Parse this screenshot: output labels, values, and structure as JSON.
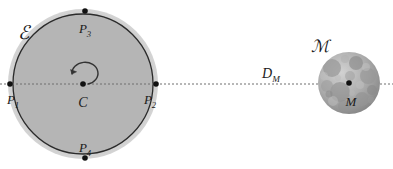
{
  "figure": {
    "background_color": "#ffffff"
  },
  "earth": {
    "label": "ℰ",
    "label_name": "script-E",
    "center_label": "C",
    "center": {
      "x": 83,
      "y": 84
    },
    "halo_radius": 75,
    "body_radius": 70,
    "halo_color": "#c9c9c9",
    "body_color": "#b4b4b4",
    "outline_color": "#2b2b2b",
    "rotation_direction": "counterclockwise",
    "points": [
      {
        "id": "P1",
        "label": "P",
        "sub": "1",
        "x": 10,
        "y": 84,
        "label_x": 13,
        "label_y": 102,
        "anchor": "middle"
      },
      {
        "id": "P2",
        "label": "P",
        "sub": "2",
        "x": 156,
        "y": 84,
        "label_x": 152,
        "label_y": 102,
        "anchor": "middle"
      },
      {
        "id": "P3",
        "label": "P",
        "sub": "3",
        "x": 85,
        "y": 11,
        "label_x": 85,
        "label_y": 33,
        "anchor": "middle"
      },
      {
        "id": "P4",
        "label": "P",
        "sub": "4",
        "x": 85,
        "y": 158,
        "label_x": 85,
        "label_y": 152,
        "anchor": "middle"
      }
    ]
  },
  "moon": {
    "label": "ℳ",
    "label_name": "script-M",
    "center_label": "M",
    "center": {
      "x": 349,
      "y": 83
    },
    "radius": 31,
    "base_color": "#a8a8a8",
    "label_x": 320,
    "label_y": 51,
    "center_label_x": 351,
    "center_label_y": 104,
    "craters": [
      {
        "cx": 332,
        "cy": 68,
        "r": 9,
        "fill": "#999999",
        "opacity": 0.75
      },
      {
        "cx": 356,
        "cy": 63,
        "r": 7,
        "fill": "#8f8f8f",
        "opacity": 0.7
      },
      {
        "cx": 368,
        "cy": 76,
        "r": 8,
        "fill": "#969696",
        "opacity": 0.65
      },
      {
        "cx": 340,
        "cy": 92,
        "r": 10,
        "fill": "#8d8d8d",
        "opacity": 0.6
      },
      {
        "cx": 362,
        "cy": 99,
        "r": 7,
        "fill": "#949494",
        "opacity": 0.7
      },
      {
        "cx": 327,
        "cy": 86,
        "r": 6,
        "fill": "#9d9d9d",
        "opacity": 0.6
      },
      {
        "cx": 350,
        "cy": 76,
        "r": 5,
        "fill": "#a0a0a0",
        "opacity": 0.55
      },
      {
        "cx": 372,
        "cy": 90,
        "r": 5,
        "fill": "#8a8a8a",
        "opacity": 0.6
      },
      {
        "cx": 344,
        "cy": 106,
        "r": 6,
        "fill": "#929292",
        "opacity": 0.55
      },
      {
        "cx": 333,
        "cy": 101,
        "r": 5,
        "fill": "#bdbdbd",
        "opacity": 0.5
      },
      {
        "cx": 360,
        "cy": 85,
        "r": 4,
        "fill": "#bfbfbf",
        "opacity": 0.5
      },
      {
        "cx": 324,
        "cy": 76,
        "r": 4,
        "fill": "#c2c2c2",
        "opacity": 0.45
      },
      {
        "cx": 366,
        "cy": 67,
        "r": 4,
        "fill": "#c4c4c4",
        "opacity": 0.45
      },
      {
        "cx": 352,
        "cy": 93,
        "r": 3,
        "fill": "#b8b8b8",
        "opacity": 0.5
      },
      {
        "cx": 338,
        "cy": 78,
        "r": 3,
        "fill": "#bbbbbb",
        "opacity": 0.45
      }
    ]
  },
  "distance": {
    "label": "D",
    "sub": "M",
    "label_x": 264,
    "label_y": 78,
    "line": {
      "x1": 0,
      "y1": 84,
      "x2": 393,
      "y2": 84
    },
    "line_color": "#6f6f6f",
    "dash": "2 2"
  }
}
